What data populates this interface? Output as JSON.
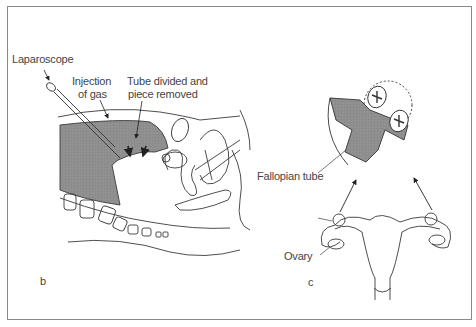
{
  "figure": {
    "panel_b": {
      "panel_label": "b",
      "labels": {
        "laparoscope": "Laparoscope",
        "injection_line1": "Injection",
        "injection_line2": "of gas",
        "tube_line1": "Tube divided and",
        "tube_line2": "piece removed"
      }
    },
    "panel_c": {
      "panel_label": "c",
      "labels": {
        "fallopian_tube": "Fallopian tube",
        "ovary": "Ovary"
      }
    },
    "colors": {
      "line": "#3a3a3a",
      "shade": "#8c8c8c",
      "label_text": "#444444",
      "frame": "#8a8a8a"
    }
  }
}
